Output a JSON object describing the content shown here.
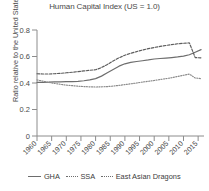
{
  "chart_data": {
    "type": "line",
    "title": "Human Capital Index (US = 1.0)",
    "xlabel": "",
    "ylabel": "Ratio relative to the United States",
    "xlim": [
      1960,
      2017
    ],
    "ylim": [
      0,
      0.8
    ],
    "grid": false,
    "legend_position": "bottom",
    "xticks": [
      1960,
      1965,
      1970,
      1975,
      1980,
      1985,
      1990,
      1995,
      2000,
      2005,
      2010,
      2015
    ],
    "xtick_labels": [
      "1960",
      "1965",
      "1970",
      "1975",
      "1980",
      "1985",
      "1990",
      "1995",
      "2000",
      "2005",
      "2010",
      "2015"
    ],
    "yticks": [
      0,
      0.2,
      0.4,
      0.6,
      0.8
    ],
    "ytick_labels": [
      "0",
      "0.2",
      "0.4",
      "0.6",
      "0.8"
    ],
    "x": [
      1960,
      1962,
      1964,
      1966,
      1968,
      1970,
      1972,
      1974,
      1976,
      1978,
      1980,
      1982,
      1984,
      1986,
      1988,
      1990,
      1992,
      1994,
      1996,
      1998,
      2000,
      2002,
      2004,
      2006,
      2008,
      2010,
      2012,
      2014,
      2016
    ],
    "series": [
      {
        "name": "GHA",
        "style": "solid",
        "color": "#6d6d6d",
        "values": [
          0.405,
          0.405,
          0.406,
          0.408,
          0.409,
          0.41,
          0.411,
          0.413,
          0.417,
          0.424,
          0.433,
          0.452,
          0.477,
          0.502,
          0.527,
          0.545,
          0.555,
          0.562,
          0.568,
          0.574,
          0.581,
          0.585,
          0.588,
          0.592,
          0.597,
          0.603,
          0.613,
          0.632,
          0.652
        ]
      },
      {
        "name": "SSA",
        "style": "dotted",
        "color": "#8a8a8a",
        "values": [
          0.423,
          0.414,
          0.405,
          0.397,
          0.39,
          0.384,
          0.38,
          0.376,
          0.373,
          0.371,
          0.37,
          0.371,
          0.373,
          0.377,
          0.382,
          0.388,
          0.394,
          0.4,
          0.407,
          0.413,
          0.419,
          0.426,
          0.433,
          0.44,
          0.449,
          0.458,
          0.467,
          0.438,
          0.433
        ]
      },
      {
        "name": "East Asian Dragons",
        "style": "dashed",
        "color": "#5c5c5c",
        "values": [
          0.47,
          0.468,
          0.468,
          0.47,
          0.473,
          0.477,
          0.481,
          0.486,
          0.491,
          0.496,
          0.5,
          0.516,
          0.54,
          0.566,
          0.59,
          0.61,
          0.624,
          0.637,
          0.649,
          0.659,
          0.668,
          0.676,
          0.683,
          0.69,
          0.696,
          0.7,
          0.703,
          0.592,
          0.59
        ]
      }
    ]
  },
  "legend": {
    "entries": [
      {
        "label": "GHA",
        "style": "solid"
      },
      {
        "label": "SSA",
        "style": "dotted"
      },
      {
        "label": "East Asian Dragons",
        "style": "dotted"
      }
    ]
  }
}
